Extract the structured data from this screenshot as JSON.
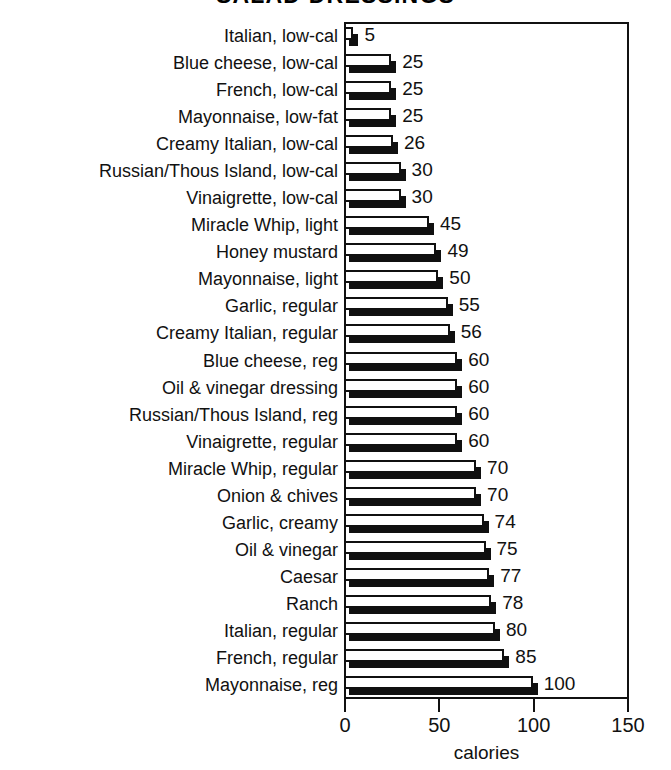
{
  "chart_data": {
    "type": "bar",
    "orientation": "horizontal",
    "title": "SALAD DRESSINGS",
    "title_note": "cropped at top edge of scanned image",
    "xlabel": "calories",
    "ylabel": "",
    "xlim": [
      0,
      150
    ],
    "xticks": [
      0,
      50,
      100,
      150
    ],
    "xtick_labels": [
      "0",
      "50",
      "100",
      "150"
    ],
    "grid": false,
    "legend": false,
    "bar_style": "3d-shadow-white-face",
    "categories": [
      "Italian, low-cal",
      "Blue cheese, low-cal",
      "French, low-cal",
      "Mayonnaise, low-fat",
      "Creamy Italian, low-cal",
      "Russian/Thous Island, low-cal",
      "Vinaigrette, low-cal",
      "Miracle Whip, light",
      "Honey mustard",
      "Mayonnaise, light",
      "Garlic, regular",
      "Creamy Italian, regular",
      "Blue cheese, reg",
      "Oil & vinegar dressing",
      "Russian/Thous Island, reg",
      "Vinaigrette, regular",
      "Miracle Whip, regular",
      "Onion & chives",
      "Garlic, creamy",
      "Oil & vinegar",
      "Caesar",
      "Ranch",
      "Italian, regular",
      "French, regular",
      "Mayonnaise, reg"
    ],
    "values": [
      5,
      25,
      25,
      25,
      26,
      30,
      30,
      45,
      49,
      50,
      55,
      56,
      60,
      60,
      60,
      60,
      70,
      70,
      74,
      75,
      77,
      78,
      80,
      85,
      100
    ],
    "value_labels": [
      "5",
      "25",
      "25",
      "25",
      "26",
      "30",
      "30",
      "45",
      "49",
      "50",
      "55",
      "56",
      "60",
      "60",
      "60",
      "60",
      "70",
      "70",
      "74",
      "75",
      "77",
      "78",
      "80",
      "85",
      "100"
    ],
    "colors": {
      "bar_face": "#ffffff",
      "bar_outline": "#101010",
      "bar_shadow": "#101010",
      "axis": "#111111",
      "text": "#111111",
      "background": "#ffffff"
    }
  }
}
